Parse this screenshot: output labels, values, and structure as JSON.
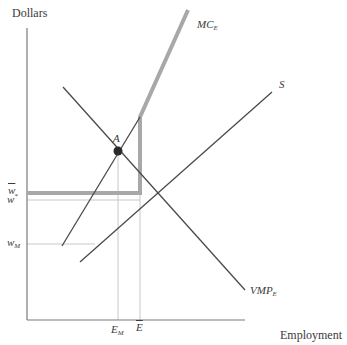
{
  "diagram": {
    "y_axis_label": "Dollars",
    "x_axis_label": "Employment",
    "curves": {
      "mc": {
        "label": "MC",
        "sub": "E"
      },
      "supply": {
        "label": "S"
      },
      "vmp": {
        "label": "VMP",
        "sub": "E"
      }
    },
    "point": {
      "label": "A"
    },
    "y_ticks": {
      "w_star": {
        "label": "w",
        "sup": "*"
      },
      "w_bar": {
        "label": "w",
        "accent": "bar"
      },
      "w_m": {
        "label": "w",
        "sub": "M"
      }
    },
    "x_ticks": {
      "e_m": {
        "label": "E",
        "sub": "M"
      },
      "e_bar": {
        "label": "E",
        "accent": "bar"
      }
    },
    "colors": {
      "line": "#4a4a4a",
      "highlight": "#a8a8a8",
      "guide": "#c8c8c8",
      "axis": "#7a7a7a"
    }
  }
}
